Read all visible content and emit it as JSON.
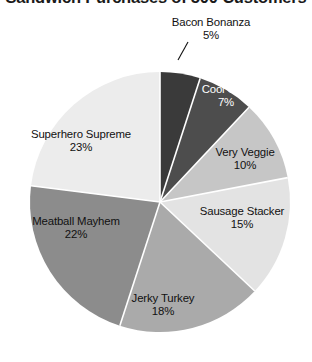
{
  "chart_data": {
    "type": "pie",
    "title": "Sandwich Purchases of 500 Customers",
    "xlabel": "",
    "ylabel": "",
    "legend_position": "none",
    "labels_inline": true,
    "start_angle_deg": 0,
    "direction": "clockwise",
    "categories": [
      "Bacon Bonanza",
      "Cool Club",
      "Very Veggie",
      "Sausage Stacker",
      "Jerky Turkey",
      "Meatball Mayhem",
      "Superhero Supreme"
    ],
    "values": [
      5,
      7,
      10,
      15,
      18,
      22,
      23
    ],
    "value_labels": [
      "5%",
      "7%",
      "10%",
      "15%",
      "18%",
      "22%",
      "23%"
    ],
    "units": "percent",
    "total": 100,
    "slices": [
      {
        "name": "Bacon Bonanza",
        "pct_label": "5%",
        "value": 5,
        "color": "#3a3a3a",
        "text_color": "#111111",
        "label_placement": "outside",
        "has_leader_line": true
      },
      {
        "name": "Cool Club",
        "pct_label": "7%",
        "value": 7,
        "color": "#4d4d4d",
        "text_color": "#ffffff",
        "label_placement": "inside",
        "has_leader_line": false
      },
      {
        "name": "Very Veggie",
        "pct_label": "10%",
        "value": 10,
        "color": "#c6c6c6",
        "text_color": "#111111",
        "label_placement": "inside",
        "has_leader_line": false
      },
      {
        "name": "Sausage Stacker",
        "pct_label": "15%",
        "value": 15,
        "color": "#e3e3e3",
        "text_color": "#111111",
        "label_placement": "inside",
        "has_leader_line": false
      },
      {
        "name": "Jerky Turkey",
        "pct_label": "18%",
        "value": 18,
        "color": "#aaaaaa",
        "text_color": "#111111",
        "label_placement": "inside",
        "has_leader_line": false
      },
      {
        "name": "Meatball Mayhem",
        "pct_label": "22%",
        "value": 22,
        "color": "#8c8c8c",
        "text_color": "#111111",
        "label_placement": "inside",
        "has_leader_line": false
      },
      {
        "name": "Superhero Supreme",
        "pct_label": "23%",
        "value": 23,
        "color": "#ececec",
        "text_color": "#111111",
        "label_placement": "inside",
        "has_leader_line": false
      }
    ]
  },
  "title": {
    "text": "Sandwich Purchases of 500 Customers"
  },
  "labels": {
    "bacon": {
      "name": "Bacon Bonanza",
      "pct": "5%"
    },
    "cool": {
      "name": "Cool Club",
      "pct": "7%"
    },
    "veggie": {
      "name": "Very Veggie",
      "pct": "10%"
    },
    "sausage": {
      "name": "Sausage Stacker",
      "pct": "15%"
    },
    "jerky": {
      "name": "Jerky Turkey",
      "pct": "18%"
    },
    "meatball": {
      "name": "Meatball Mayhem",
      "pct": "22%"
    },
    "superhero": {
      "name": "Superhero Supreme",
      "pct": "23%"
    }
  },
  "colors": {
    "background": "#ffffff",
    "text": "#111111",
    "text_on_dark": "#ffffff",
    "slice_edge": "#ffffff"
  }
}
